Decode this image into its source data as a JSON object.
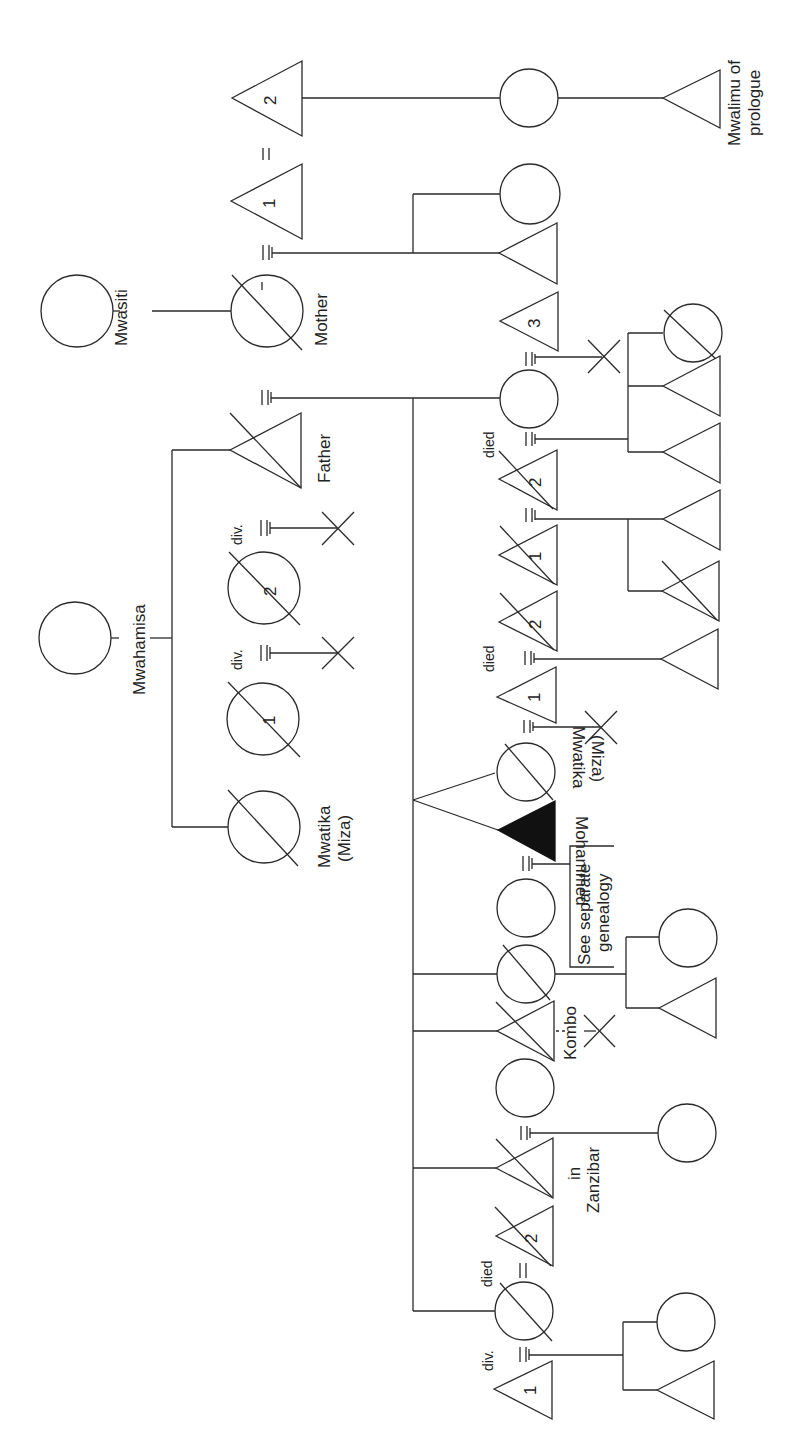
{
  "diagram": {
    "type": "genealogy",
    "orientation": "rotated 90deg (text reads bottom-to-top)",
    "labels": {
      "mwasiti": "Mwasiti",
      "mother": "Mother",
      "mwalimu": "Mwalimu of",
      "mwalimu2": "prologue",
      "mwahamisa": "Mwahamisa",
      "father": "Father",
      "mwatika_top": "Mwatika",
      "miza_top": "(Miza)",
      "mwatika_inv": "Mwatika",
      "miza_inv": "(Miza)",
      "mohammed": "Mohammed",
      "see_sep1": "See separate",
      "see_sep2": "genealogy",
      "kombo": "Kombo",
      "in": "in",
      "zanzibar": "Zanzibar",
      "died": "died",
      "div": "div.",
      "n1": "1",
      "n2": "2",
      "n3": "3"
    }
  }
}
